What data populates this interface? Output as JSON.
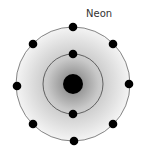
{
  "title": "Neon",
  "atom": {
    "element": "Neon",
    "nucleus": {
      "cx": 73,
      "cy": 84,
      "r": 10
    },
    "shells": [
      {
        "r": 30,
        "electrons": 2
      },
      {
        "r": 57,
        "electrons": 8
      }
    ],
    "colors": {
      "electron": "#000000",
      "ring": "#555555",
      "glow_center": "#8a8a8a",
      "glow_edge": "#f2f2f2"
    }
  }
}
